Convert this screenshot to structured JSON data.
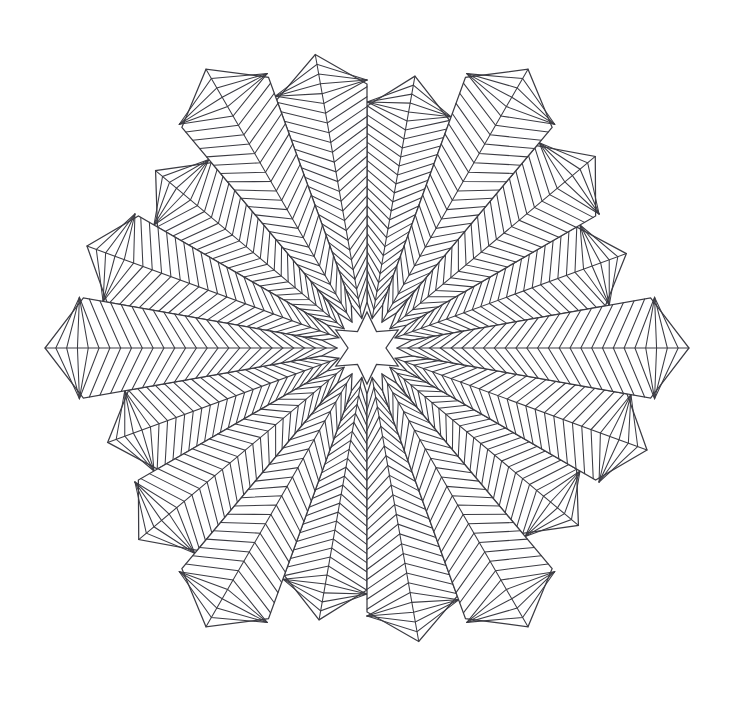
{
  "artwork": {
    "title": "Geometric Star Mandala Line Drawing",
    "type": "line-art-coloring-page",
    "background_color": "#ffffff",
    "line_color": "#3b3b42",
    "line_width_px": 1.05,
    "canvas": {
      "width": 734,
      "height": 701
    }
  },
  "geometry": {
    "center": {
      "x": 367,
      "y": 348
    },
    "petal_count": 18,
    "petal_angular_width_deg": 20,
    "rotation_offset_deg": 0,
    "chevron_stripe_count_per_petal": 26,
    "stripe_spacing_px": 13,
    "pattern": "herringbone-chevron",
    "extents": {
      "left_tip": {
        "x": 46,
        "y": 352
      },
      "right_tip": {
        "x": 690,
        "y": 352
      },
      "top_tips": [
        {
          "x": 307,
          "y": 41
        },
        {
          "x": 417,
          "y": 41
        }
      ],
      "bottom_tips": [
        {
          "x": 310,
          "y": 655
        },
        {
          "x": 418,
          "y": 655
        }
      ]
    },
    "petal_tip_radii_px": [
      322,
      298,
      276,
      322,
      298,
      276,
      322,
      298,
      276,
      322,
      298,
      276,
      322,
      298,
      276,
      322,
      298,
      276
    ],
    "petal_inner_radius_px": 30
  },
  "center_star": {
    "points": 6,
    "outer_radius_px": 36,
    "inner_radius_px": 19,
    "orientation_deg": 90,
    "fill": "#ffffff",
    "stroke": "#3b3b42"
  },
  "chart_data": {
    "type": "scatter",
    "xlabel": "",
    "ylabel": "",
    "series": [
      {
        "name": "petal tip radius by petal index",
        "x": [
          0,
          1,
          2,
          3,
          4,
          5,
          6,
          7,
          8,
          9,
          10,
          11,
          12,
          13,
          14,
          15,
          16,
          17
        ],
        "values": [
          322,
          298,
          276,
          322,
          298,
          276,
          322,
          298,
          276,
          322,
          298,
          276,
          322,
          298,
          276,
          322,
          298,
          276
        ]
      }
    ],
    "categories": [
      "0°",
      "20°",
      "40°",
      "60°",
      "80°",
      "100°",
      "120°",
      "140°",
      "160°",
      "180°",
      "200°",
      "220°",
      "240°",
      "260°",
      "280°",
      "300°",
      "320°",
      "340°"
    ],
    "legend": [],
    "annotations": [],
    "grid": false
  }
}
